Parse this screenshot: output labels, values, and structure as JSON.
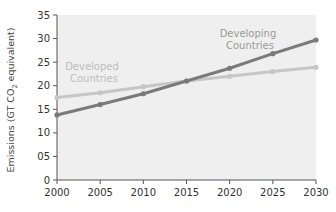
{
  "chart_data": {
    "type": "line",
    "title": "",
    "xlabel": "",
    "ylabel": "Emissions (GT CO2 equivalent)",
    "ylabel_parts": {
      "pre": "Emissions (GT CO",
      "sub": "2",
      "post": " equivalent)"
    },
    "x": [
      2000,
      2005,
      2010,
      2015,
      2020,
      2025,
      2030
    ],
    "x_tick_labels": [
      "2000",
      "2005",
      "2010",
      "2015",
      "2020",
      "2025",
      "2030"
    ],
    "y_tick_labels": [
      "0",
      "05",
      "10",
      "15",
      "20",
      "25",
      "30",
      "35"
    ],
    "y_ticks": [
      0,
      5,
      10,
      15,
      20,
      25,
      30,
      35
    ],
    "ylim": [
      0,
      35
    ],
    "xlim": [
      2000,
      2030
    ],
    "grid": false,
    "legend": "inline labels",
    "series": [
      {
        "name": "Developed Countries",
        "label_lines": [
          "Developed",
          "Countries"
        ],
        "color": "#c6c6c6",
        "label_color": "#bdbdbd",
        "values": [
          17.5,
          18.5,
          19.8,
          21.0,
          22.0,
          23.0,
          23.9
        ]
      },
      {
        "name": "Developing Countries",
        "label_lines": [
          "Developing",
          "Countries"
        ],
        "color": "#7a7a7a",
        "label_color": "#9a9a9a",
        "values": [
          13.8,
          16.0,
          18.3,
          21.0,
          23.7,
          26.8,
          29.7
        ]
      }
    ],
    "plot_background": "#efefef"
  }
}
